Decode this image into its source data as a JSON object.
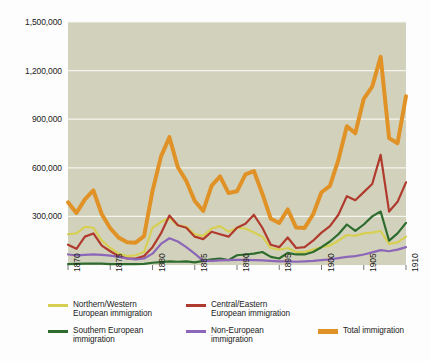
{
  "chart_data": {
    "type": "line",
    "title": "",
    "subtitle": "",
    "xlabel": "",
    "ylabel": "",
    "xlim": [
      1870,
      1910
    ],
    "ylim": [
      0,
      1500000
    ],
    "grid": true,
    "grid_orientation": "horizontal",
    "legend_position": "bottom",
    "plot_background": "#d2d2bc",
    "x": [
      1870,
      1871,
      1872,
      1873,
      1874,
      1875,
      1876,
      1877,
      1878,
      1879,
      1880,
      1881,
      1882,
      1883,
      1884,
      1885,
      1886,
      1887,
      1888,
      1889,
      1890,
      1891,
      1892,
      1893,
      1894,
      1895,
      1896,
      1897,
      1898,
      1899,
      1900,
      1901,
      1902,
      1903,
      1904,
      1905,
      1906,
      1907,
      1908,
      1909,
      1910
    ],
    "xticks": [
      1870,
      1875,
      1880,
      1885,
      1890,
      1895,
      1900,
      1905,
      1910
    ],
    "xticklabels": [
      "1870",
      "1875",
      "1880",
      "1885",
      "1890",
      "1895",
      "1900",
      "1905",
      "1910"
    ],
    "yticks": [
      300000,
      600000,
      900000,
      1200000,
      1500000
    ],
    "yticklabels": [
      "300,000",
      "600,000",
      "900,000",
      "1,200,000",
      "1,500,000"
    ],
    "series": [
      {
        "name": "Northern/Western European immigration",
        "legend_label": "Northern/Western\nEuropean immigration",
        "color": "#d6cf52",
        "width": 2.2,
        "values": [
          190000,
          195000,
          235000,
          230000,
          150000,
          105000,
          70000,
          55000,
          60000,
          80000,
          230000,
          265000,
          290000,
          245000,
          235000,
          190000,
          180000,
          225000,
          240000,
          205000,
          230000,
          225000,
          200000,
          175000,
          105000,
          95000,
          105000,
          80000,
          80000,
          95000,
          110000,
          120000,
          150000,
          185000,
          180000,
          195000,
          200000,
          210000,
          130000,
          140000,
          175000
        ]
      },
      {
        "name": "Central/Eastern European immigration",
        "legend_label": "Central/Eastern\nEuropean immigration",
        "color": "#b03a2e",
        "width": 2.2,
        "values": [
          125000,
          100000,
          175000,
          195000,
          120000,
          85000,
          55000,
          40000,
          40000,
          55000,
          110000,
          195000,
          305000,
          245000,
          230000,
          175000,
          160000,
          205000,
          190000,
          175000,
          230000,
          255000,
          310000,
          230000,
          125000,
          110000,
          170000,
          105000,
          110000,
          150000,
          200000,
          240000,
          310000,
          425000,
          400000,
          450000,
          500000,
          680000,
          330000,
          390000,
          510000
        ]
      },
      {
        "name": "Southern European immigration",
        "legend_label": "Southern European\nimmigration",
        "color": "#2e6b2e",
        "width": 2.2,
        "values": [
          6000,
          7000,
          8000,
          9000,
          8000,
          6000,
          5000,
          5000,
          5000,
          7000,
          14000,
          18000,
          22000,
          20000,
          22000,
          16000,
          25000,
          35000,
          40000,
          30000,
          60000,
          65000,
          70000,
          80000,
          50000,
          40000,
          75000,
          65000,
          65000,
          80000,
          110000,
          145000,
          190000,
          250000,
          210000,
          250000,
          300000,
          330000,
          150000,
          195000,
          260000
        ]
      },
      {
        "name": "Non-European immigration",
        "legend_label": "Non-European\nimmigration",
        "color": "#8c66b8",
        "width": 2.2,
        "values": [
          65000,
          60000,
          62000,
          65000,
          62000,
          58000,
          50000,
          40000,
          35000,
          40000,
          70000,
          130000,
          165000,
          145000,
          110000,
          70000,
          25000,
          25000,
          28000,
          30000,
          32000,
          32000,
          30000,
          28000,
          25000,
          22000,
          22000,
          20000,
          22000,
          25000,
          30000,
          35000,
          42000,
          50000,
          55000,
          65000,
          78000,
          92000,
          85000,
          95000,
          110000
        ]
      },
      {
        "name": "Total immigration",
        "legend_label": "Total immigration",
        "color": "#e09227",
        "width": 4.0,
        "values": [
          387000,
          321000,
          405000,
          460000,
          313000,
          227000,
          169000,
          141000,
          138000,
          178000,
          457000,
          669000,
          789000,
          603000,
          519000,
          395000,
          334000,
          490000,
          547000,
          444000,
          455000,
          560000,
          580000,
          440000,
          285000,
          259000,
          343000,
          231000,
          229000,
          312000,
          449000,
          488000,
          649000,
          857000,
          813000,
          1026000,
          1101000,
          1285000,
          783000,
          752000,
          1042000
        ]
      }
    ]
  },
  "legend": {
    "items": [
      {
        "key": "nw",
        "label": "Northern/Western\nEuropean immigration",
        "color": "#d6cf52",
        "style": "thin"
      },
      {
        "key": "ce",
        "label": "Central/Eastern\nEuropean immigration",
        "color": "#b03a2e",
        "style": "thin"
      },
      {
        "key": "se",
        "label": "Southern European\nimmigration",
        "color": "#2e6b2e",
        "style": "thin"
      },
      {
        "key": "ne",
        "label": "Non-European\nimmigration",
        "color": "#8c66b8",
        "style": "thin"
      },
      {
        "key": "total",
        "label": "Total immigration",
        "color": "#e09227",
        "style": "thick"
      }
    ]
  }
}
